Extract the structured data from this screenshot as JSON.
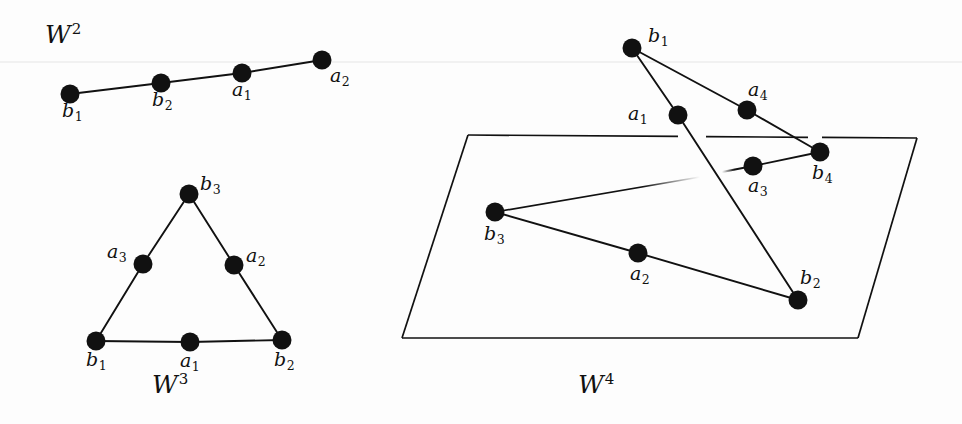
{
  "figure": {
    "caption_absent": true,
    "background_color": "#fdfdfd",
    "ink_color": "#111111",
    "scan_artifact_line_y": 62,
    "width": 962,
    "height": 424
  },
  "panels": [
    {
      "id": "w2",
      "name": "wedge-2",
      "label": {
        "base": "W",
        "exponent": "2",
        "x": 45,
        "y": 22
      },
      "shape": "path",
      "vertices": [
        {
          "name": "b1",
          "base": "b",
          "sub": "1",
          "x": 70,
          "y": 94,
          "label_x": 62,
          "label_y": 101
        },
        {
          "name": "b2",
          "base": "b",
          "sub": "2",
          "x": 161,
          "y": 83,
          "label_x": 152,
          "label_y": 90
        },
        {
          "name": "a1",
          "base": "a",
          "sub": "1",
          "x": 242,
          "y": 73,
          "label_x": 232,
          "label_y": 80
        },
        {
          "name": "a2",
          "base": "a",
          "sub": "2",
          "x": 322,
          "y": 60,
          "label_x": 330,
          "label_y": 66
        }
      ],
      "edges": [
        [
          "b1",
          "b2"
        ],
        [
          "b2",
          "a1"
        ],
        [
          "a1",
          "a2"
        ]
      ]
    },
    {
      "id": "w3",
      "name": "wedge-3",
      "label": {
        "base": "W",
        "exponent": "3",
        "x": 152,
        "y": 372
      },
      "shape": "triangle",
      "vertices": [
        {
          "name": "b3",
          "base": "b",
          "sub": "3",
          "x": 189,
          "y": 194,
          "label_x": 200,
          "label_y": 174
        },
        {
          "name": "a3",
          "base": "a",
          "sub": "3",
          "x": 143,
          "y": 264,
          "label_x": 107,
          "label_y": 242
        },
        {
          "name": "a2",
          "base": "a",
          "sub": "2",
          "x": 234,
          "y": 265,
          "label_x": 246,
          "label_y": 246
        },
        {
          "name": "b1",
          "base": "b",
          "sub": "1",
          "x": 96,
          "y": 341,
          "label_x": 86,
          "label_y": 350
        },
        {
          "name": "a1",
          "base": "a",
          "sub": "1",
          "x": 190,
          "y": 342,
          "label_x": 180,
          "label_y": 351
        },
        {
          "name": "b2",
          "base": "b",
          "sub": "2",
          "x": 282,
          "y": 340,
          "label_x": 274,
          "label_y": 350
        }
      ],
      "edges": [
        [
          "b1",
          "a3"
        ],
        [
          "a3",
          "b3"
        ],
        [
          "b3",
          "a2"
        ],
        [
          "a2",
          "b2"
        ],
        [
          "b1",
          "a1"
        ],
        [
          "a1",
          "b2"
        ]
      ]
    },
    {
      "id": "w4",
      "name": "wedge-4",
      "label": {
        "base": "W",
        "exponent": "4",
        "x": 578,
        "y": 372
      },
      "shape": "plane-with-graph",
      "plane": {
        "name": "ambient-plane",
        "corners": [
          [
            468,
            135
          ],
          [
            917,
            138
          ],
          [
            858,
            338
          ],
          [
            402,
            338
          ]
        ],
        "top_edge_gaps": [
          [
            678,
            706
          ],
          [
            808,
            822
          ]
        ]
      },
      "vertices": [
        {
          "name": "b1",
          "base": "b",
          "sub": "1",
          "x": 632,
          "y": 48,
          "label_x": 648,
          "label_y": 26
        },
        {
          "name": "a1",
          "base": "a",
          "sub": "1",
          "x": 678,
          "y": 115,
          "label_x": 628,
          "label_y": 104
        },
        {
          "name": "a4",
          "base": "a",
          "sub": "4",
          "x": 747,
          "y": 110,
          "label_x": 748,
          "label_y": 80
        },
        {
          "name": "b4",
          "base": "b",
          "sub": "4",
          "x": 820,
          "y": 152,
          "label_x": 812,
          "label_y": 163
        },
        {
          "name": "a3",
          "base": "a",
          "sub": "3",
          "x": 753,
          "y": 166,
          "label_x": 748,
          "label_y": 176
        },
        {
          "name": "b3",
          "base": "b",
          "sub": "3",
          "x": 495,
          "y": 212,
          "label_x": 484,
          "label_y": 224
        },
        {
          "name": "a2",
          "base": "a",
          "sub": "2",
          "x": 638,
          "y": 253,
          "label_x": 630,
          "label_y": 264
        },
        {
          "name": "b2",
          "base": "b",
          "sub": "2",
          "x": 798,
          "y": 300,
          "label_x": 800,
          "label_y": 268
        }
      ],
      "edges": [
        [
          "b1",
          "a1"
        ],
        [
          "b1",
          "a4"
        ],
        [
          "a4",
          "b4"
        ],
        [
          "b4",
          "a3"
        ],
        [
          "a1",
          "b2"
        ],
        [
          "b3",
          "a2"
        ],
        [
          "a2",
          "b2"
        ]
      ],
      "partial_edges": [
        {
          "from": "b3",
          "to": "a1",
          "name": "b3-a1-occluded",
          "fade_at": 0.6
        },
        {
          "from": "a3",
          "to": "b3",
          "name": "a3-b3-occluded",
          "fade_at": 0.12
        }
      ]
    }
  ],
  "legend_absent": true
}
